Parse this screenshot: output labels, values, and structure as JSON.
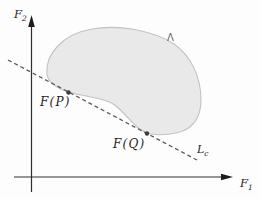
{
  "figure": {
    "colors": {
      "background": "#fdfdfd",
      "axis": "#2e2e2e",
      "arrowhead": "#1c1c1c",
      "region_fill": "#e9e9e9",
      "region_stroke": "#c2c2c2",
      "dashed_line": "#5a5a5a",
      "point": "#3d3d3d",
      "label_text": "#1f1f1f",
      "region_label_text": "#666666"
    },
    "labels": {
      "x_axis": {
        "base": "F",
        "sub": "1"
      },
      "y_axis": {
        "base": "F",
        "sub": "2"
      },
      "region": "Λ",
      "point_p": "F(P)",
      "point_q": "F(Q)",
      "support_line": {
        "base": "L",
        "sub": "c"
      }
    }
  }
}
